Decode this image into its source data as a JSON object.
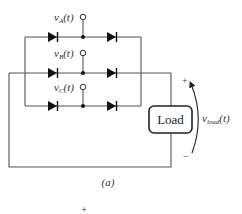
{
  "diagram": {
    "type": "three-phase diode bridge rectifier",
    "sources": [
      {
        "id": "A",
        "label": "v",
        "sub": "A",
        "arg": "(t)"
      },
      {
        "id": "B",
        "label": "v",
        "sub": "B",
        "arg": "(t)"
      },
      {
        "id": "C",
        "label": "v",
        "sub": "C",
        "arg": "(t)"
      }
    ],
    "load": {
      "label": "Load"
    },
    "output_voltage": {
      "label": "v",
      "sub": "load",
      "arg": "(t)",
      "plus": "+",
      "minus": "−"
    },
    "caption": "(a)",
    "stray_mark": "+",
    "colors": {
      "wire": "#555555",
      "diode": "#111111",
      "text": "#333333",
      "background": "#ffffff"
    }
  }
}
